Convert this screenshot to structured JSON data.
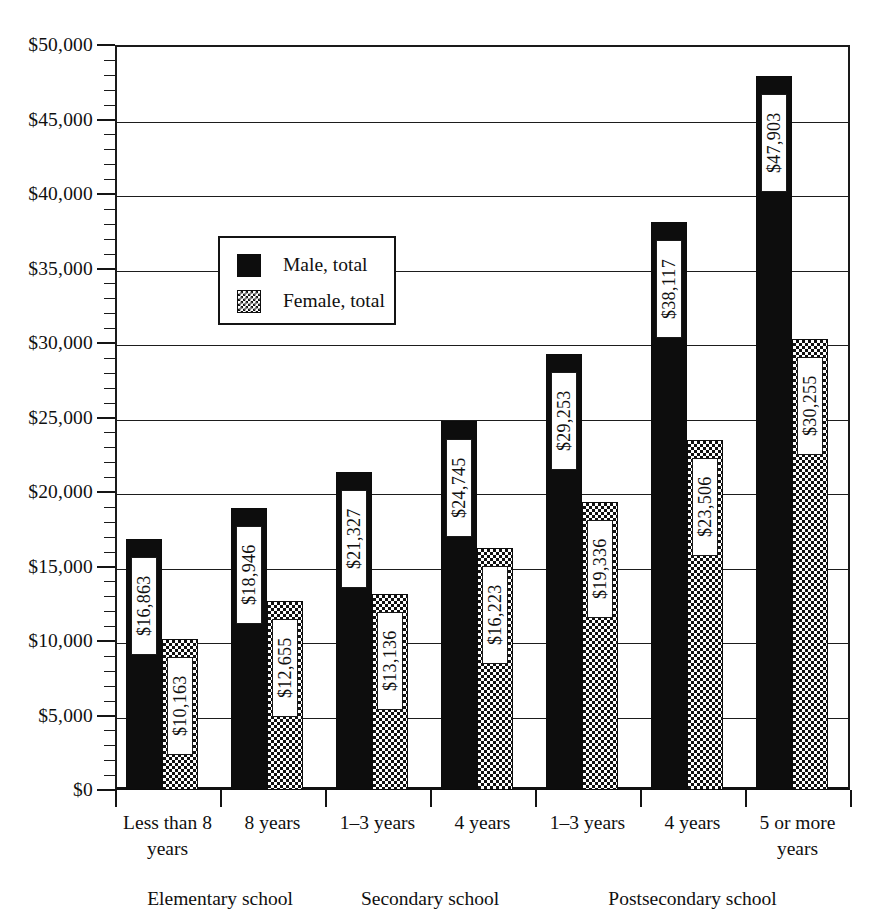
{
  "chart_data": {
    "type": "bar",
    "title": "",
    "subtitle": "",
    "xlabel": "",
    "ylabel": "",
    "ylim": [
      0,
      50000
    ],
    "y_major_step": 5000,
    "y_minor_step": 1000,
    "grid": true,
    "legend_position": "inside-upper-left",
    "orientation": "vertical",
    "grouping": "clustered",
    "value_label_rotation": -90,
    "categories": [
      "Less than 8 years",
      "8 years",
      "1–3 years",
      "4 years",
      "1–3 years",
      "4 years",
      "5 or more years"
    ],
    "category_lines": [
      [
        "Less than 8",
        "years"
      ],
      [
        "8 years"
      ],
      [
        "1–3 years"
      ],
      [
        "4 years"
      ],
      [
        "1–3 years"
      ],
      [
        "4 years"
      ],
      [
        "5 or more",
        "years"
      ]
    ],
    "super_groups": [
      {
        "label": "Elementary school",
        "categories": [
          0,
          1
        ]
      },
      {
        "label": "Secondary school",
        "categories": [
          2,
          3
        ]
      },
      {
        "label": "Postsecondary school",
        "categories": [
          4,
          5,
          6
        ]
      }
    ],
    "series": [
      {
        "name": "Male, total",
        "fill": "solid-black",
        "color": "#0d0d0d",
        "values": [
          16863,
          18946,
          21327,
          24745,
          29253,
          38117,
          47903
        ],
        "value_labels": [
          "$16,863",
          "$18,946",
          "$21,327",
          "$24,745",
          "$29,253",
          "$38,117",
          "$47,903"
        ]
      },
      {
        "name": "Female, total",
        "fill": "checkerboard",
        "color": "#111111",
        "values": [
          10163,
          12655,
          13136,
          16223,
          19336,
          23506,
          30255
        ],
        "value_labels": [
          "$10,163",
          "$12,655",
          "$13,136",
          "$16,223",
          "$19,336",
          "$23,506",
          "$30,255"
        ]
      }
    ],
    "y_tick_labels": [
      "$0",
      "$5,000",
      "$10,000",
      "$15,000",
      "$20,000",
      "$25,000",
      "$30,000",
      "$35,000",
      "$40,000",
      "$45,000",
      "$50,000"
    ],
    "y_tick_values": [
      0,
      5000,
      10000,
      15000,
      20000,
      25000,
      30000,
      35000,
      40000,
      45000,
      50000
    ]
  },
  "legend": {
    "items": [
      {
        "label": "Male, total",
        "swatch": "solid-black-swatch"
      },
      {
        "label": "Female, total",
        "swatch": "checkerboard-swatch"
      }
    ]
  }
}
